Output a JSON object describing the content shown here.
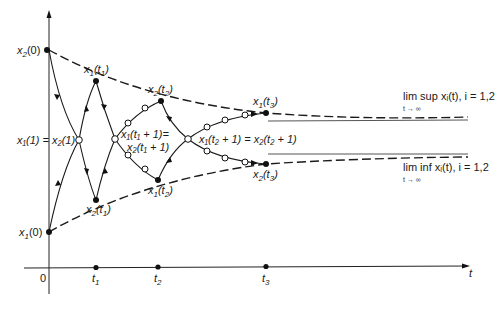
{
  "diagram": {
    "axes": {
      "x_label": "t",
      "origin_label": "0",
      "ticks": [
        {
          "label": "t",
          "sub": "1",
          "x": 96
        },
        {
          "label": "t",
          "sub": "2",
          "x": 158
        },
        {
          "label": "t",
          "sub": "3",
          "x": 266
        }
      ]
    },
    "points": {
      "x2_0": {
        "label": "x",
        "sub": "2",
        "suffix": "(0)"
      },
      "x1_0": {
        "label": "x",
        "sub": "1",
        "suffix": "(0)"
      },
      "x1_t1": {
        "label": "x",
        "sub": "1",
        "suffix": "(t",
        "sub2": "1",
        "suffix2": ")"
      },
      "x2_t1": {
        "label": "x",
        "sub": "2",
        "suffix": "(t",
        "sub2": "1",
        "suffix2": ")"
      },
      "x2_t2": {
        "label": "x",
        "sub": "2",
        "suffix": "(t",
        "sub2": "2",
        "suffix2": ")"
      },
      "x1_t2": {
        "label": "x",
        "sub": "1",
        "suffix": "(t",
        "sub2": "2",
        "suffix2": ")"
      },
      "x1_t3": {
        "label": "x",
        "sub": "1",
        "suffix": "(t",
        "sub2": "3",
        "suffix2": ")"
      },
      "x2_t3": {
        "label": "x",
        "sub": "2",
        "suffix": "(t",
        "sub2": "3",
        "suffix2": ")"
      }
    },
    "equalities": {
      "eq1": "x₁(1) = x₂(1)",
      "eq2_line1": "x₁(t₁ + 1)=",
      "eq2_line2": "x₂(t₁ + 1)",
      "eq3": "x₁(t₂ + 1) = x₂(t₂ + 1)"
    },
    "limits": {
      "sup_label": "lim sup xᵢ(t), i = 1,2",
      "sup_sub": "t → ∞",
      "inf_label": "lim inf xᵢ(t), i = 1,2",
      "inf_sub": "t → ∞"
    }
  }
}
